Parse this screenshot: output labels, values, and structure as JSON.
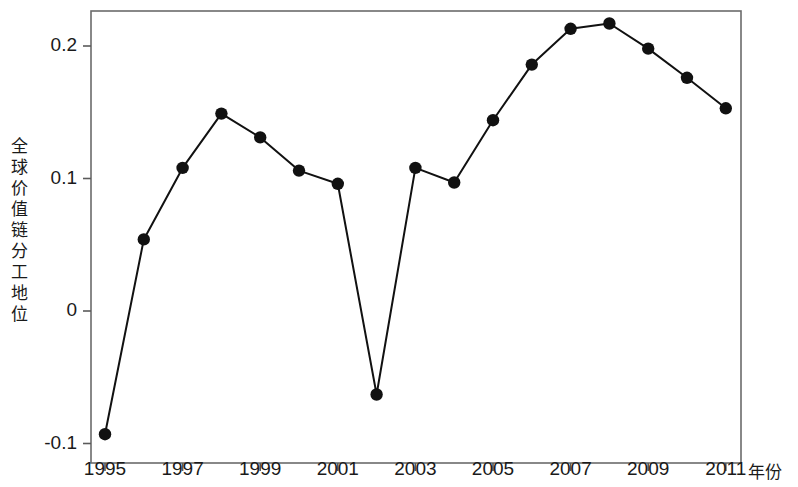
{
  "chart_data": {
    "type": "line",
    "title": "",
    "xlabel": "年份",
    "ylabel": "全球价值链分工地位",
    "x": [
      1995,
      1996,
      1997,
      1998,
      1999,
      2000,
      2001,
      2002,
      2003,
      2004,
      2005,
      2006,
      2007,
      2008,
      2009,
      2010,
      2011
    ],
    "values": [
      -0.093,
      0.054,
      0.108,
      0.149,
      0.131,
      0.106,
      0.096,
      -0.063,
      0.108,
      0.097,
      0.144,
      0.186,
      0.213,
      0.217,
      0.198,
      0.176,
      0.153
    ],
    "series": [
      {
        "name": "全球价值链分工地位",
        "values": [
          -0.093,
          0.054,
          0.108,
          0.149,
          0.131,
          0.106,
          0.096,
          -0.063,
          0.108,
          0.097,
          0.144,
          0.186,
          0.213,
          0.217,
          0.198,
          0.176,
          0.153
        ]
      }
    ],
    "xlim": [
      1994.6,
      1994.6
    ],
    "ylim": [
      -0.11,
      0.225
    ],
    "xticks": [
      1995,
      1997,
      1999,
      2001,
      2003,
      2005,
      2007,
      2009,
      2011
    ],
    "xtick_labels": [
      "1995",
      "1997",
      "1999",
      "2001",
      "2003",
      "2005",
      "2007",
      "2009",
      "2011"
    ],
    "yticks": [
      -0.1,
      0,
      0.1,
      0.2
    ],
    "ytick_labels": [
      "-0.1",
      "0",
      "0.1",
      "0.2"
    ],
    "grid": false,
    "legend": null,
    "marker": "filled-circle",
    "line_color": "#111111",
    "marker_color": "#111111",
    "axis_color": "#5a5a5a",
    "background": "#ffffff"
  },
  "axes": {
    "y_axis_title_chars": "全\n球\n价\n值\n链\n分\n工\n地\n位",
    "x_axis_title": "年份"
  }
}
